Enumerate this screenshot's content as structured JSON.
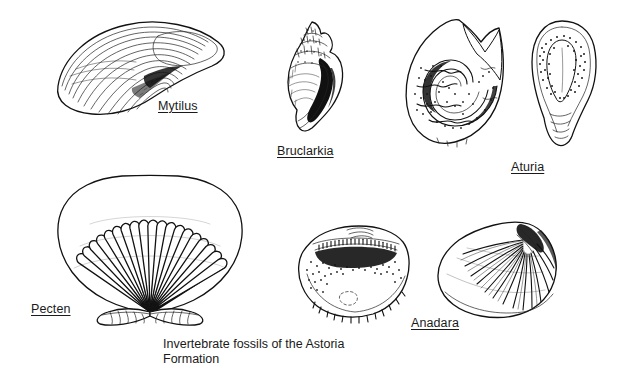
{
  "plate": {
    "title": "Invertebrate fossils of the Astoria Formation",
    "background_color": "#ffffff",
    "ink_color": "#111111",
    "caption": "Invertebrate fossils of the Astoria\nFormation",
    "caption_line_1": "Invertebrate fossils of the Astoria",
    "caption_line_2": "Formation"
  },
  "specimens": [
    {
      "label": "Mytilus",
      "common_name": "mussel",
      "group": "bivalve",
      "views": 1,
      "description": "elongate wedge-shaped mussel shell with concentric growth lines"
    },
    {
      "label": "Bruclarkia",
      "common_name": "snail",
      "group": "gastropod",
      "views": 1,
      "description": "high-spired gastropod shell with beaded spire and dark aperture"
    },
    {
      "label": "Aturia",
      "common_name": "nautiloid",
      "group": "cephalopod",
      "views": 2,
      "description": "coiled nautiloid, lateral view with sinuous sutures and ventral apertural view"
    },
    {
      "label": "Pecten",
      "common_name": "scallop",
      "group": "bivalve",
      "views": 1,
      "description": "fan-shaped scallop with strong radial ribs and hinge auricles"
    },
    {
      "label": "Anadara",
      "common_name": "ark clam",
      "group": "bivalve",
      "views": 2,
      "description": "interior view showing taxodont hinge teeth and exterior view with radial ribs"
    }
  ]
}
